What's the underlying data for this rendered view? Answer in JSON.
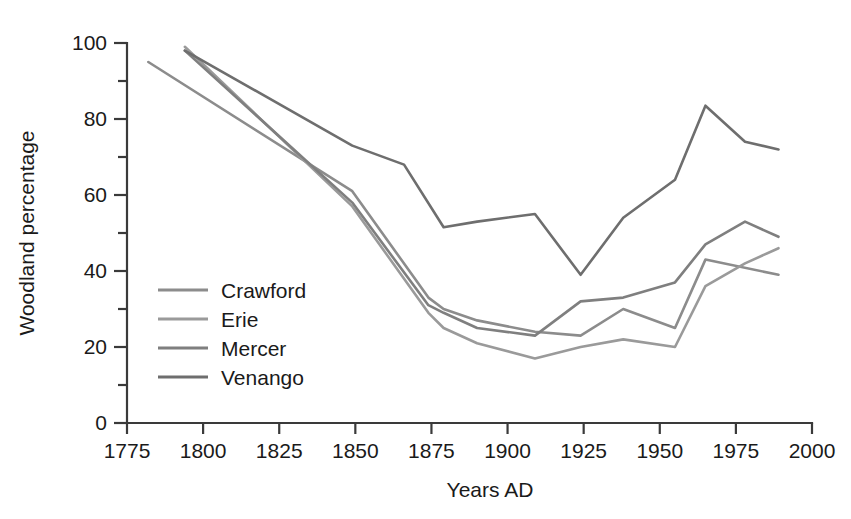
{
  "chart_data": {
    "type": "line",
    "title": "",
    "xlabel": "Years AD",
    "ylabel": "Woodland percentage",
    "xlim": [
      1775,
      2000
    ],
    "ylim": [
      0,
      100
    ],
    "xticks": [
      1775,
      1800,
      1825,
      1850,
      1875,
      1900,
      1925,
      1950,
      1975,
      2000
    ],
    "xtick_labels": [
      "1775",
      "1800",
      "1825",
      "1850",
      "1875",
      "1900",
      "1925",
      "1950",
      "1975",
      "2000"
    ],
    "yticks": [
      0,
      20,
      40,
      60,
      80,
      100
    ],
    "ytick_labels": [
      "0",
      "20",
      "40",
      "60",
      "80",
      "100"
    ],
    "yticks_minor": [
      10,
      30,
      50,
      70,
      90
    ],
    "grid": false,
    "legend_position": "center-left",
    "series": [
      {
        "name": "Crawford",
        "color": "#8c8c8c",
        "points": [
          [
            1782,
            95
          ],
          [
            1849,
            61
          ],
          [
            1874,
            33
          ],
          [
            1879,
            30
          ],
          [
            1890,
            27
          ],
          [
            1909,
            24
          ],
          [
            1924,
            23
          ],
          [
            1938,
            30
          ],
          [
            1955,
            25
          ],
          [
            1965,
            43
          ],
          [
            1989,
            39
          ]
        ]
      },
      {
        "name": "Erie",
        "color": "#9a9a9a",
        "points": [
          [
            1794,
            99
          ],
          [
            1849,
            57
          ],
          [
            1874,
            29
          ],
          [
            1879,
            25
          ],
          [
            1890,
            21
          ],
          [
            1909,
            17
          ],
          [
            1924,
            20
          ],
          [
            1938,
            22
          ],
          [
            1955,
            20
          ],
          [
            1965,
            36
          ],
          [
            1978,
            42
          ],
          [
            1989,
            46
          ]
        ]
      },
      {
        "name": "Mercer",
        "color": "#7f7f7f",
        "points": [
          [
            1794,
            98
          ],
          [
            1849,
            58
          ],
          [
            1874,
            31
          ],
          [
            1879,
            29
          ],
          [
            1890,
            25
          ],
          [
            1909,
            23
          ],
          [
            1924,
            32
          ],
          [
            1938,
            33
          ],
          [
            1955,
            37
          ],
          [
            1965,
            47
          ],
          [
            1978,
            53
          ],
          [
            1989,
            49
          ]
        ]
      },
      {
        "name": "Venango",
        "color": "#6e6e6e",
        "points": [
          [
            1794,
            98
          ],
          [
            1849,
            73
          ],
          [
            1866,
            68
          ],
          [
            1879,
            51.5
          ],
          [
            1890,
            53
          ],
          [
            1909,
            55
          ],
          [
            1924,
            39
          ],
          [
            1938,
            54
          ],
          [
            1955,
            64
          ],
          [
            1965,
            83.5
          ],
          [
            1978,
            74
          ],
          [
            1989,
            72
          ]
        ]
      }
    ]
  },
  "legend": {
    "items": [
      {
        "label": "Crawford"
      },
      {
        "label": "Erie"
      },
      {
        "label": "Mercer"
      },
      {
        "label": "Venango"
      }
    ]
  }
}
